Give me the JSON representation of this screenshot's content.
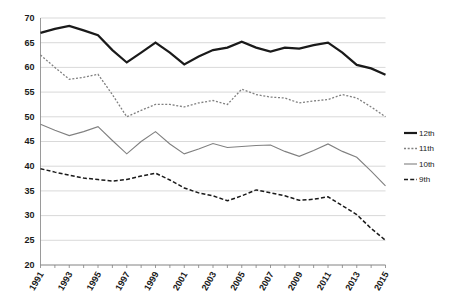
{
  "chart_data": {
    "type": "line",
    "title": "",
    "subtitle": "",
    "xlabel": "",
    "ylabel": "",
    "ylim": [
      20,
      70
    ],
    "ytick_step": 5,
    "yticks": [
      20,
      25,
      30,
      35,
      40,
      45,
      50,
      55,
      60,
      65,
      70
    ],
    "grid": true,
    "grid_axis": "y",
    "legend_position": "right",
    "x": [
      1991,
      1992,
      1993,
      1994,
      1995,
      1996,
      1997,
      1998,
      1999,
      2000,
      2001,
      2002,
      2003,
      2004,
      2005,
      2006,
      2007,
      2008,
      2009,
      2010,
      2011,
      2012,
      2013,
      2014,
      2015
    ],
    "xtick_labels": [
      "1991",
      "1993",
      "1995",
      "1997",
      "1999",
      "2001",
      "2003",
      "2005",
      "2007",
      "2009",
      "2011",
      "2013",
      "2015"
    ],
    "xtick_label_years": [
      1991,
      1993,
      1995,
      1997,
      1999,
      2001,
      2003,
      2005,
      2007,
      2009,
      2011,
      2013,
      2015
    ],
    "series": [
      {
        "name": "12th",
        "style": "solid-thick",
        "color": "#1a1a1a",
        "width": 2.2,
        "values": [
          67.0,
          67.8,
          68.4,
          67.5,
          66.5,
          63.5,
          61.0,
          63.0,
          65.0,
          63.0,
          60.6,
          62.2,
          63.5,
          64.0,
          65.2,
          64.0,
          63.2,
          64.0,
          63.8,
          64.5,
          65.0,
          63.0,
          60.5,
          59.8,
          58.5
        ]
      },
      {
        "name": "11th",
        "style": "dotted",
        "color": "#808080",
        "width": 1.3,
        "values": [
          62.5,
          60.0,
          57.6,
          58.0,
          58.6,
          54.5,
          50.0,
          51.3,
          52.5,
          52.5,
          52.0,
          52.8,
          53.3,
          52.5,
          55.6,
          54.5,
          54.0,
          53.8,
          52.8,
          53.2,
          53.5,
          54.5,
          53.8,
          52.0,
          50.0
        ]
      },
      {
        "name": "10th",
        "style": "solid-thin",
        "color": "#808080",
        "width": 1.1,
        "values": [
          48.5,
          47.3,
          46.2,
          47.0,
          48.0,
          45.2,
          42.5,
          45.0,
          47.0,
          44.5,
          42.5,
          43.5,
          44.6,
          43.8,
          44.0,
          44.2,
          44.3,
          43.0,
          42.0,
          43.2,
          44.5,
          43.0,
          41.8,
          39.0,
          36.0
        ]
      },
      {
        "name": "9th",
        "style": "dashed",
        "color": "#1a1a1a",
        "width": 1.5,
        "values": [
          39.5,
          38.8,
          38.2,
          37.6,
          37.3,
          37.0,
          37.3,
          38.0,
          38.6,
          37.2,
          35.6,
          34.6,
          34.0,
          33.0,
          34.0,
          35.2,
          34.6,
          34.0,
          33.1,
          33.3,
          33.8,
          32.0,
          30.2,
          27.4,
          25.0
        ]
      }
    ],
    "legend": [
      {
        "label": "12th",
        "style": "solid-thick",
        "color": "#1a1a1a"
      },
      {
        "label": "11th",
        "style": "dotted",
        "color": "#808080"
      },
      {
        "label": "10th",
        "style": "solid-thin",
        "color": "#808080"
      },
      {
        "label": "9th",
        "style": "dashed",
        "color": "#1a1a1a"
      }
    ]
  }
}
